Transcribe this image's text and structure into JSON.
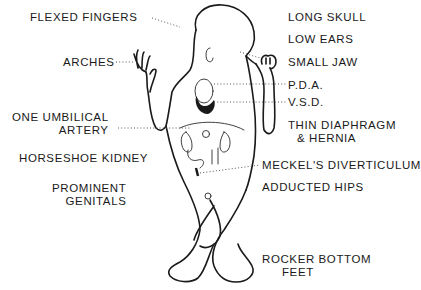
{
  "diagram": {
    "left_labels": [
      {
        "id": "flexed-fingers",
        "lines": [
          "FLEXED FINGERS"
        ]
      },
      {
        "id": "arches",
        "lines": [
          "ARCHES"
        ]
      },
      {
        "id": "one-umbilical-artery",
        "lines": [
          "ONE UMBILICAL",
          "ARTERY"
        ]
      },
      {
        "id": "horseshoe-kidney",
        "lines": [
          "HORSESHOE KIDNEY"
        ]
      },
      {
        "id": "prominent-genitals",
        "lines": [
          "PROMINENT",
          "GENITALS"
        ]
      }
    ],
    "right_labels": [
      {
        "id": "long-skull",
        "lines": [
          "LONG SKULL"
        ]
      },
      {
        "id": "low-ears",
        "lines": [
          "LOW EARS"
        ]
      },
      {
        "id": "small-jaw",
        "lines": [
          "SMALL JAW"
        ]
      },
      {
        "id": "pda",
        "lines": [
          "P.D.A."
        ]
      },
      {
        "id": "vsd",
        "lines": [
          "V.S.D."
        ]
      },
      {
        "id": "thin-diaphragm",
        "lines": [
          "THIN DIAPHRAGM",
          "& HERNIA"
        ]
      },
      {
        "id": "meckels-diverticulum",
        "lines": [
          "MECKEL'S DIVERTICULUM"
        ]
      },
      {
        "id": "adducted-hips",
        "lines": [
          "ADDUCTED HIPS"
        ]
      },
      {
        "id": "rocker-bottom-feet",
        "lines": [
          "ROCKER BOTTOM",
          "FEET"
        ]
      }
    ],
    "colors": {
      "ink": "#1a1a1a",
      "background": "#ffffff"
    }
  }
}
